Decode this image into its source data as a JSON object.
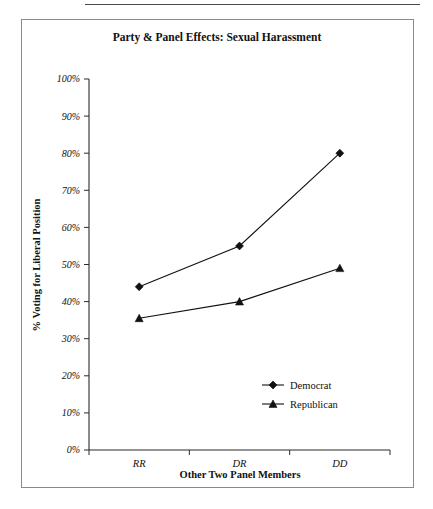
{
  "figure": {
    "has_top_rule": true,
    "has_border": true
  },
  "chart_data": {
    "type": "line",
    "title": "Party & Panel Effects: Sexual Harassment",
    "xlabel": "Other Two Panel Members",
    "ylabel": "% Voting for Liberal Position",
    "categories": [
      "RR",
      "DR",
      "DD"
    ],
    "ylim": [
      0,
      100
    ],
    "ytick_labels": [
      "0%",
      "10%",
      "20%",
      "30%",
      "40%",
      "50%",
      "60%",
      "70%",
      "80%",
      "90%",
      "100%"
    ],
    "ytick_values": [
      0,
      10,
      20,
      30,
      40,
      50,
      60,
      70,
      80,
      90,
      100
    ],
    "grid": false,
    "legend_position": "inside-lower-right",
    "series": [
      {
        "name": "Democrat",
        "marker": "diamond",
        "color": "#111111",
        "values": [
          44,
          55,
          80
        ]
      },
      {
        "name": "Republican",
        "marker": "triangle",
        "color": "#111111",
        "values": [
          35.5,
          40,
          49
        ]
      }
    ]
  }
}
